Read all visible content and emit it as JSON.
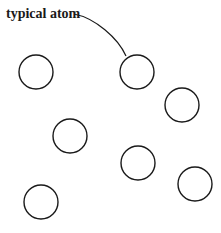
{
  "diagram": {
    "label": "typical atom",
    "label_target_index": 1,
    "stroke_color": "#1a1a1a",
    "atoms": [
      {
        "cx": 36,
        "cy": 72,
        "r": 17
      },
      {
        "cx": 137,
        "cy": 72,
        "r": 17
      },
      {
        "cx": 182,
        "cy": 105,
        "r": 17
      },
      {
        "cx": 70,
        "cy": 136,
        "r": 17
      },
      {
        "cx": 138,
        "cy": 163,
        "r": 17
      },
      {
        "cx": 195,
        "cy": 184,
        "r": 17
      },
      {
        "cx": 41,
        "cy": 202,
        "r": 17
      }
    ]
  }
}
